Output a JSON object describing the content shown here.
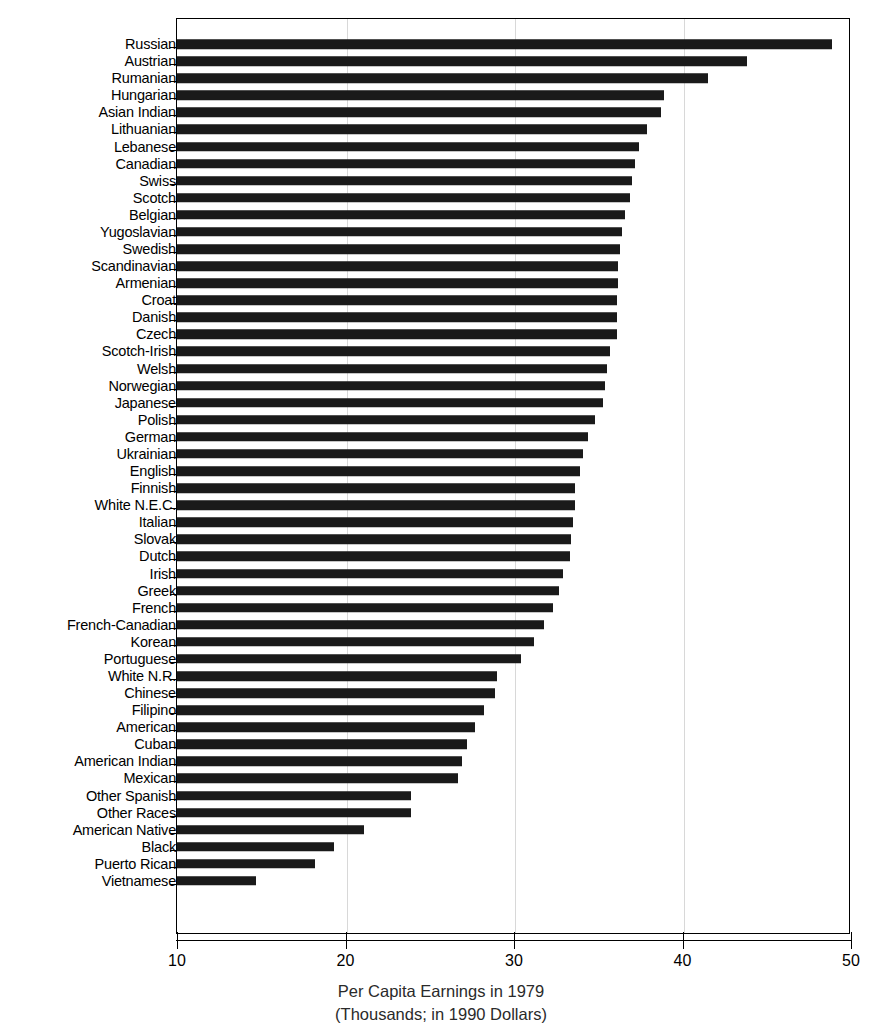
{
  "chart_data": {
    "type": "bar",
    "orientation": "horizontal",
    "title": "",
    "xlabel": "Per Capita Earnings in 1979 (Thousands; in 1990 Dollars)",
    "ylabel": "",
    "xlim": [
      10,
      50
    ],
    "xticks": [
      10,
      20,
      30,
      40,
      50
    ],
    "xticklabels": [
      "10",
      "20",
      "30",
      "40",
      "50"
    ],
    "grid": false,
    "legend": null,
    "bar_color": "#1a1a1a",
    "categories": [
      "Russian",
      "Austrian",
      "Rumanian",
      "Hungarian",
      "Asian Indian",
      "Lithuanian",
      "Lebanese",
      "Canadian",
      "Swiss",
      "Scotch",
      "Belgian",
      "Yugoslavian",
      "Swedish",
      "Scandinavian",
      "Armenian",
      "Croat",
      "Danish",
      "Czech",
      "Scotch-Irish",
      "Welsh",
      "Norwegian",
      "Japanese",
      "Polish",
      "German",
      "Ukrainian",
      "English",
      "Finnish",
      "White N.E.C.",
      "Italian",
      "Slovak",
      "Dutch",
      "Irish",
      "Greek",
      "French",
      "French-Canadian",
      "Korean",
      "Portuguese",
      "White N.R.",
      "Chinese",
      "Filipino",
      "American",
      "Cuban",
      "American Indian",
      "Mexican",
      "Other Spanish",
      "Other Races",
      "American Native",
      "Black",
      "Puerto Rican",
      "Vietnamese"
    ],
    "values": [
      48.9,
      43.8,
      41.5,
      38.9,
      38.7,
      37.9,
      37.4,
      37.2,
      37.0,
      36.9,
      36.6,
      36.4,
      36.3,
      36.2,
      36.2,
      36.1,
      36.1,
      36.1,
      35.7,
      35.5,
      35.4,
      35.3,
      34.8,
      34.4,
      34.1,
      33.9,
      33.6,
      33.6,
      33.5,
      33.4,
      33.3,
      32.9,
      32.7,
      32.3,
      31.8,
      31.2,
      30.4,
      29.0,
      28.9,
      28.2,
      27.7,
      27.2,
      26.9,
      26.7,
      23.9,
      23.9,
      21.1,
      19.3,
      18.2,
      14.7
    ]
  },
  "axis": {
    "x_caption_line1": "Per Capita Earnings in 1979",
    "x_caption_line2": "(Thousands; in 1990 Dollars)"
  }
}
